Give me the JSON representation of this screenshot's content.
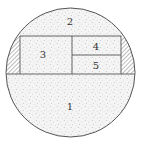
{
  "diagram": {
    "type": "circle-partition",
    "stroke_color": "#555555",
    "fill_color": "#f2f2f2",
    "stipple_color": "#9a9a9a",
    "hatch_color": "#777777",
    "circle": {
      "cx": 70.5,
      "cy": 72.5,
      "r": 64.5
    },
    "regions": [
      {
        "id": "1",
        "label": "1",
        "description": "lower segment below horizontal line"
      },
      {
        "id": "2",
        "label": "2",
        "description": "upper segment above horizontal line"
      },
      {
        "id": "3",
        "label": "3",
        "description": "left rectangle in central band"
      },
      {
        "id": "4",
        "label": "4",
        "description": "upper-right rectangle in central band"
      },
      {
        "id": "5",
        "label": "5",
        "description": "lower-right rectangle in central band"
      }
    ],
    "hatched_areas": [
      {
        "id": "left-lens",
        "description": "hatched lens between circle edge and left rectangle"
      },
      {
        "id": "right-lens",
        "description": "hatched lens between circle edge and right rectangle"
      }
    ]
  }
}
